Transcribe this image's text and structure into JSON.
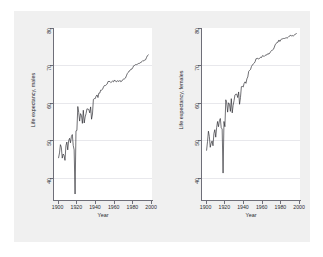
{
  "figure": {
    "background_color": "#f0f0f0",
    "panel_color": "#ffffff",
    "line_color": "#24242a",
    "grid_color": "#e8e8ec"
  },
  "chart_data": [
    {
      "type": "line",
      "title": "",
      "xlabel": "Year",
      "ylabel": "Life expectancy, males",
      "xlim": [
        1895,
        2002
      ],
      "ylim": [
        35,
        81
      ],
      "xticks": [
        1900,
        1920,
        1940,
        1960,
        1980,
        2000
      ],
      "yticks": [
        40,
        50,
        60,
        70,
        80
      ],
      "xtick_labels": [
        "1900",
        "1920",
        "1940",
        "1960",
        "1980",
        "2000"
      ],
      "ytick_labels": [
        "40",
        "50",
        "60",
        "70",
        "80"
      ],
      "grid": true,
      "legend": "none",
      "series": [
        {
          "name": "Life expectancy, males",
          "x": [
            1900,
            1901,
            1902,
            1903,
            1904,
            1905,
            1906,
            1907,
            1908,
            1909,
            1910,
            1911,
            1912,
            1913,
            1914,
            1915,
            1916,
            1917,
            1918,
            1919,
            1920,
            1921,
            1922,
            1923,
            1924,
            1925,
            1926,
            1927,
            1928,
            1929,
            1930,
            1931,
            1932,
            1933,
            1934,
            1935,
            1936,
            1937,
            1938,
            1939,
            1940,
            1941,
            1942,
            1943,
            1944,
            1945,
            1946,
            1947,
            1948,
            1949,
            1950,
            1951,
            1952,
            1953,
            1954,
            1955,
            1956,
            1957,
            1958,
            1959,
            1960,
            1961,
            1962,
            1963,
            1964,
            1965,
            1966,
            1967,
            1968,
            1969,
            1970,
            1971,
            1972,
            1973,
            1974,
            1975,
            1976,
            1977,
            1978,
            1979,
            1980,
            1981,
            1982,
            1983,
            1984,
            1985,
            1986,
            1987,
            1988,
            1989,
            1990,
            1991,
            1992,
            1993,
            1994,
            1995,
            1996,
            1997,
            1998
          ],
          "y": [
            46.3,
            47.6,
            49.8,
            49.1,
            46.2,
            47.3,
            46.9,
            45.6,
            49.5,
            50.5,
            48.4,
            50.9,
            51.5,
            50.3,
            52.0,
            52.5,
            49.6,
            48.4,
            36.6,
            53.5,
            53.6,
            60.0,
            58.4,
            56.1,
            58.1,
            57.6,
            55.5,
            59.0,
            55.6,
            57.2,
            58.1,
            59.4,
            59.3,
            59.2,
            58.3,
            59.9,
            56.6,
            58.0,
            61.9,
            62.1,
            62.1,
            62.8,
            63.1,
            62.4,
            63.6,
            63.6,
            64.4,
            64.4,
            64.6,
            65.2,
            65.6,
            65.6,
            65.8,
            66.0,
            66.7,
            66.7,
            66.7,
            66.4,
            66.6,
            66.8,
            66.6,
            67.1,
            66.8,
            66.6,
            66.9,
            66.8,
            66.7,
            67.0,
            66.6,
            66.8,
            67.1,
            67.4,
            67.4,
            67.6,
            68.2,
            68.8,
            69.1,
            69.5,
            69.6,
            70.0,
            70.0,
            70.4,
            70.9,
            71.0,
            71.2,
            71.2,
            71.3,
            71.5,
            71.5,
            71.7,
            71.8,
            72.0,
            72.3,
            72.2,
            72.4,
            72.5,
            73.1,
            73.6,
            73.8
          ]
        }
      ]
    },
    {
      "type": "line",
      "title": "",
      "xlabel": "Year",
      "ylabel": "Life expectancy, females",
      "xlim": [
        1895,
        2002
      ],
      "ylim": [
        35,
        81
      ],
      "xticks": [
        1900,
        1920,
        1940,
        1960,
        1980,
        2000
      ],
      "yticks": [
        40,
        50,
        60,
        70,
        80
      ],
      "xtick_labels": [
        "1900",
        "1920",
        "1940",
        "1960",
        "1980",
        "2000"
      ],
      "ytick_labels": [
        "40",
        "50",
        "60",
        "70",
        "80"
      ],
      "grid": true,
      "legend": "none",
      "series": [
        {
          "name": "Life expectancy, females",
          "x": [
            1900,
            1901,
            1902,
            1903,
            1904,
            1905,
            1906,
            1907,
            1908,
            1909,
            1910,
            1911,
            1912,
            1913,
            1914,
            1915,
            1916,
            1917,
            1918,
            1919,
            1920,
            1921,
            1922,
            1923,
            1924,
            1925,
            1926,
            1927,
            1928,
            1929,
            1930,
            1931,
            1932,
            1933,
            1934,
            1935,
            1936,
            1937,
            1938,
            1939,
            1940,
            1941,
            1942,
            1943,
            1944,
            1945,
            1946,
            1947,
            1948,
            1949,
            1950,
            1951,
            1952,
            1953,
            1954,
            1955,
            1956,
            1957,
            1958,
            1959,
            1960,
            1961,
            1962,
            1963,
            1964,
            1965,
            1966,
            1967,
            1968,
            1969,
            1970,
            1971,
            1972,
            1973,
            1974,
            1975,
            1976,
            1977,
            1978,
            1979,
            1980,
            1981,
            1982,
            1983,
            1984,
            1985,
            1986,
            1987,
            1988,
            1989,
            1990,
            1991,
            1992,
            1993,
            1994,
            1995,
            1996,
            1997,
            1998
          ],
          "y": [
            48.3,
            50.6,
            53.4,
            52.0,
            49.1,
            50.2,
            50.8,
            49.5,
            52.8,
            53.8,
            51.8,
            54.4,
            56.0,
            54.6,
            56.2,
            56.8,
            54.3,
            54.0,
            42.2,
            56.0,
            54.6,
            61.8,
            61.0,
            58.5,
            61.0,
            60.6,
            58.7,
            62.1,
            58.3,
            60.3,
            61.6,
            63.1,
            63.3,
            63.3,
            62.4,
            63.9,
            60.6,
            62.4,
            65.3,
            65.4,
            65.2,
            66.2,
            66.6,
            66.2,
            67.4,
            67.9,
            69.4,
            69.7,
            69.9,
            70.7,
            71.1,
            71.4,
            71.6,
            72.0,
            72.8,
            72.8,
            72.9,
            72.7,
            72.9,
            73.2,
            73.1,
            73.6,
            73.5,
            73.4,
            73.7,
            73.8,
            73.8,
            74.2,
            74.0,
            74.3,
            74.7,
            75.0,
            75.1,
            75.3,
            75.9,
            76.6,
            76.8,
            77.2,
            77.2,
            77.8,
            77.4,
            77.8,
            78.1,
            78.1,
            78.2,
            78.2,
            78.3,
            78.4,
            78.3,
            78.5,
            78.8,
            78.9,
            79.1,
            78.8,
            79.0,
            78.9,
            79.1,
            79.4,
            79.5
          ]
        }
      ]
    }
  ]
}
